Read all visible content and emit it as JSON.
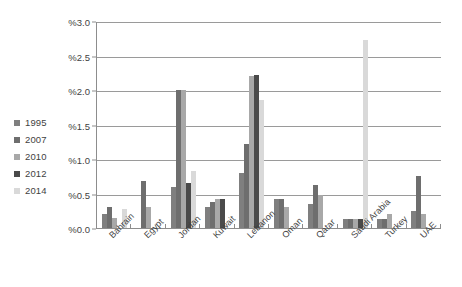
{
  "chart_data": {
    "type": "bar",
    "title": "",
    "xlabel": "",
    "ylabel": "",
    "ylim": [
      0.0,
      3.0
    ],
    "ytick_step": 0.5,
    "ytick_labels": [
      "%3.0",
      "%2.5",
      "%2.0",
      "%1.5",
      "%1.0",
      "%0.5",
      "%0.0"
    ],
    "ytick_values": [
      3.0,
      2.5,
      2.0,
      1.5,
      1.0,
      0.5,
      0.0
    ],
    "grid": true,
    "legend_position": "left",
    "categories": [
      "Bahrain",
      "Egypt",
      "Jordan",
      "Kuwait",
      "Lebanon",
      "Oman",
      "Qatar",
      "Saudi Arabia",
      "Turkey",
      "UAE"
    ],
    "series": [
      {
        "name": "1995",
        "color": "#7f7f7f",
        "values": [
          0.2,
          0.0,
          0.6,
          0.3,
          0.8,
          0.42,
          0.35,
          0.13,
          0.13,
          0.25
        ]
      },
      {
        "name": "2007",
        "color": "#6e6e6e",
        "values": [
          0.31,
          0.68,
          2.0,
          0.38,
          1.22,
          0.42,
          0.62,
          0.13,
          0.13,
          0.75
        ]
      },
      {
        "name": "2010",
        "color": "#a8a8a8",
        "values": [
          0.14,
          0.3,
          2.0,
          0.42,
          2.2,
          0.3,
          0.48,
          0.13,
          0.2,
          0.2
        ]
      },
      {
        "name": "2012",
        "color": "#4a4a4a",
        "values": [
          0.0,
          0.0,
          0.65,
          0.42,
          2.22,
          0.0,
          0.0,
          0.13,
          0.0,
          0.0
        ]
      },
      {
        "name": "2014",
        "color": "#d9d9d9",
        "values": [
          0.27,
          0.0,
          0.82,
          0.0,
          1.85,
          0.0,
          0.0,
          2.72,
          0.0,
          0.0
        ]
      }
    ]
  },
  "legend": {
    "items": [
      {
        "label": "1995",
        "color": "#7f7f7f"
      },
      {
        "label": "2007",
        "color": "#6e6e6e"
      },
      {
        "label": "2010",
        "color": "#a8a8a8"
      },
      {
        "label": "2012",
        "color": "#4a4a4a"
      },
      {
        "label": "2014",
        "color": "#d9d9d9"
      }
    ]
  },
  "axis": {
    "grid_color": "#9a9a9a",
    "axis_color": "#8d8d8d"
  }
}
